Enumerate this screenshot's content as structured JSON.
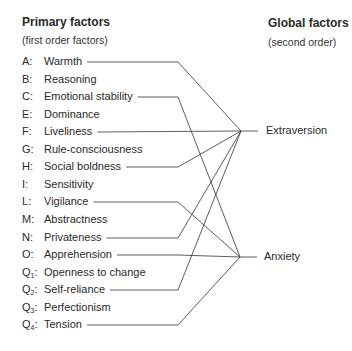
{
  "primary": {
    "title": "Primary factors",
    "subtitle": "(first order factors)",
    "factors": [
      {
        "code": "A",
        "sub": "",
        "name": "Warmth",
        "y": 62,
        "target": "extraversion"
      },
      {
        "code": "B",
        "sub": "",
        "name": "Reasoning",
        "y": 80,
        "target": null
      },
      {
        "code": "C",
        "sub": "",
        "name": "Emotional stability",
        "y": 97,
        "target": "anxiety"
      },
      {
        "code": "E",
        "sub": "",
        "name": "Dominance",
        "y": 115,
        "target": null
      },
      {
        "code": "F",
        "sub": "",
        "name": "Liveliness",
        "y": 132,
        "target": "extraversion"
      },
      {
        "code": "G",
        "sub": "",
        "name": "Rule-consciousness",
        "y": 150,
        "target": null
      },
      {
        "code": "H",
        "sub": "",
        "name": "Social boldness",
        "y": 167,
        "target": "extraversion"
      },
      {
        "code": "I",
        "sub": "",
        "name": "Sensitivity",
        "y": 185,
        "target": null
      },
      {
        "code": "L",
        "sub": "",
        "name": "Vigilance",
        "y": 202,
        "target": "anxiety"
      },
      {
        "code": "M",
        "sub": "",
        "name": "Abstractness",
        "y": 220,
        "target": null
      },
      {
        "code": "N",
        "sub": "",
        "name": "Privateness",
        "y": 238,
        "target": "extraversion"
      },
      {
        "code": "O",
        "sub": "",
        "name": "Apprehension",
        "y": 255,
        "target": "anxiety"
      },
      {
        "code": "Q",
        "sub": "1",
        "name": "Openness to change",
        "y": 273,
        "target": null
      },
      {
        "code": "Q",
        "sub": "2",
        "name": "Self-reliance",
        "y": 290,
        "target": "extraversion"
      },
      {
        "code": "Q",
        "sub": "3",
        "name": "Perfectionism",
        "y": 308,
        "target": null
      },
      {
        "code": "Q",
        "sub": "4",
        "name": "Tension",
        "y": 325,
        "target": "anxiety"
      }
    ]
  },
  "global": {
    "title": "Global factors",
    "subtitle": "(second order)",
    "factors": [
      {
        "id": "extraversion",
        "name": "Extraversion",
        "y": 131
      },
      {
        "id": "anxiety",
        "name": "Anxiety",
        "y": 257
      }
    ]
  }
}
